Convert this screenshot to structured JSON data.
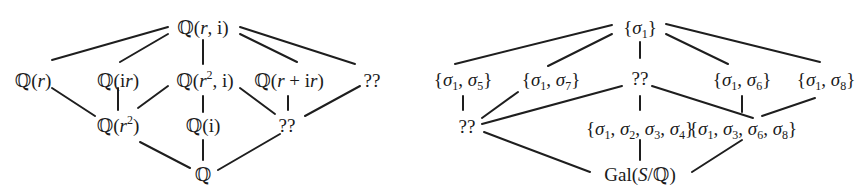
{
  "left_lattice": {
    "title": "Subfield lattice",
    "nodes": [
      {
        "id": "Qri",
        "label": "ℚ(r, i)",
        "x": 203,
        "y": 27
      },
      {
        "id": "Qr",
        "label": "ℚ(r)",
        "x": 33,
        "y": 80
      },
      {
        "id": "Qir",
        "label": "ℚ(ir)",
        "x": 118,
        "y": 80
      },
      {
        "id": "Qr2i",
        "label": "ℚ(r², i)",
        "x": 205,
        "y": 80
      },
      {
        "id": "Qrir",
        "label": "ℚ(r + ir)",
        "x": 289,
        "y": 80
      },
      {
        "id": "U1",
        "label": "??",
        "x": 372,
        "y": 80
      },
      {
        "id": "Qr2",
        "label": "ℚ(r²)",
        "x": 118,
        "y": 125
      },
      {
        "id": "Qi",
        "label": "ℚ(i)",
        "x": 203,
        "y": 125
      },
      {
        "id": "U2",
        "label": "??",
        "x": 287,
        "y": 125
      },
      {
        "id": "Q",
        "label": "ℚ",
        "x": 203,
        "y": 174
      }
    ],
    "edges": [
      [
        52,
        60,
        168,
        27
      ],
      [
        120,
        62,
        168,
        34
      ],
      [
        203,
        40,
        203,
        64
      ],
      [
        240,
        34,
        297,
        62
      ],
      [
        240,
        27,
        355,
        64
      ],
      [
        52,
        88,
        95,
        116
      ],
      [
        118,
        88,
        118,
        110
      ],
      [
        138,
        108,
        168,
        86
      ],
      [
        203,
        96,
        203,
        112
      ],
      [
        240,
        88,
        275,
        114
      ],
      [
        288,
        96,
        288,
        110
      ],
      [
        305,
        116,
        360,
        86
      ],
      [
        140,
        142,
        190,
        168
      ],
      [
        203,
        140,
        203,
        160
      ],
      [
        218,
        170,
        280,
        134
      ]
    ]
  },
  "right_lattice": {
    "title": "Subgroup lattice",
    "nodes": [
      {
        "id": "s1",
        "label": "{σ1}",
        "x": 640,
        "y": 27
      },
      {
        "id": "s15",
        "label": "{σ1, σ5}",
        "x": 463,
        "y": 79
      },
      {
        "id": "s17",
        "label": "{σ1, σ7}",
        "x": 551,
        "y": 79
      },
      {
        "id": "V1",
        "label": "??",
        "x": 640,
        "y": 78
      },
      {
        "id": "s16",
        "label": "{σ1, σ6}",
        "x": 742,
        "y": 79
      },
      {
        "id": "s18",
        "label": "{σ1, σ8}",
        "x": 826,
        "y": 79
      },
      {
        "id": "V2",
        "label": "??",
        "x": 467,
        "y": 126
      },
      {
        "id": "s1234",
        "label": "{σ1, σ2, σ3, σ4}",
        "x": 640,
        "y": 128
      },
      {
        "id": "s1368",
        "label": "{σ1, σ3, σ6, σ8}",
        "x": 743,
        "y": 128
      },
      {
        "id": "gal",
        "label": "Gal(S/ℚ)",
        "x": 640,
        "y": 174
      }
    ],
    "edges": [
      [
        455,
        64,
        612,
        25
      ],
      [
        548,
        66,
        612,
        34
      ],
      [
        640,
        42,
        640,
        58
      ],
      [
        666,
        34,
        728,
        64
      ],
      [
        666,
        24,
        820,
        62
      ],
      [
        463,
        96,
        463,
        110
      ],
      [
        482,
        118,
        518,
        92
      ],
      [
        482,
        124,
        622,
        86
      ],
      [
        640,
        96,
        640,
        110
      ],
      [
        652,
        86,
        753,
        118
      ],
      [
        742,
        96,
        742,
        112
      ],
      [
        762,
        116,
        815,
        98
      ],
      [
        484,
        132,
        590,
        172
      ],
      [
        640,
        140,
        640,
        160
      ],
      [
        692,
        172,
        742,
        140
      ]
    ]
  }
}
